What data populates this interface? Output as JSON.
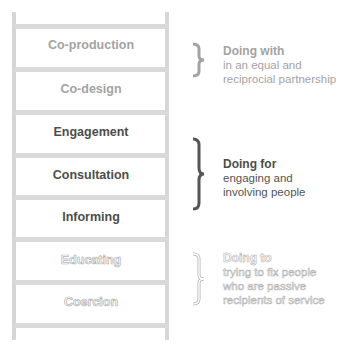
{
  "ladder": {
    "steps": [
      {
        "label": "Co-production",
        "group": "with"
      },
      {
        "label": "Co-design",
        "group": "with"
      },
      {
        "label": "Engagement",
        "group": "for"
      },
      {
        "label": "Consultation",
        "group": "for"
      },
      {
        "label": "Informing",
        "group": "for"
      },
      {
        "label": "Educating",
        "group": "to"
      },
      {
        "label": "Coercion",
        "group": "to"
      }
    ]
  },
  "groups": {
    "with": {
      "title": "Doing with",
      "desc1": "in an equal and",
      "desc2": "reciprocial partnership",
      "color": "#a3a3a3"
    },
    "for": {
      "title": "Doing for",
      "desc1": "engaging and",
      "desc2": "involving people",
      "color": "#4d4d4d"
    },
    "to": {
      "title": "Doing to",
      "desc1": "trying to fix people",
      "desc2": "who are passive",
      "desc3": "recipients of service",
      "color": "#b3b3b3"
    }
  }
}
